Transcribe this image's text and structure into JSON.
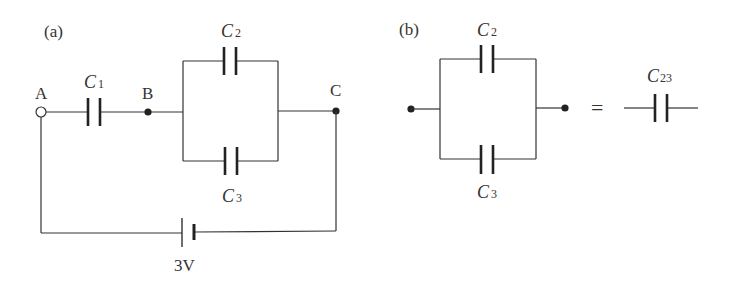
{
  "figure_a": {
    "label": "(a)",
    "nodes": {
      "A": "A",
      "B": "B",
      "C": "C"
    },
    "capacitors": {
      "c1": "C",
      "c1_sub": "1",
      "c2": "C",
      "c2_sub": "2",
      "c3": "C",
      "c3_sub": "3"
    },
    "battery": {
      "voltage": "3V"
    }
  },
  "figure_b": {
    "label": "(b)",
    "capacitors": {
      "c2": "C",
      "c2_sub": "2",
      "c3": "C",
      "c3_sub": "3",
      "c23": "C",
      "c23_sub": "23"
    },
    "equals": "="
  }
}
